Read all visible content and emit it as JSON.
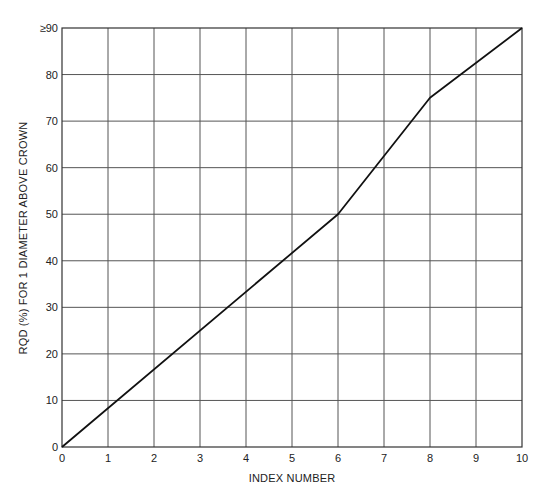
{
  "chart_data": {
    "type": "line",
    "title": "",
    "xlabel": "INDEX NUMBER",
    "ylabel": "RQD (%) FOR 1 DIAMETER ABOVE CROWN",
    "xlim": [
      0,
      10
    ],
    "ylim": [
      0,
      90
    ],
    "x_ticks": [
      "0",
      "1",
      "2",
      "3",
      "4",
      "5",
      "6",
      "7",
      "8",
      "9",
      "10"
    ],
    "y_ticks": [
      "0",
      "10",
      "20",
      "30",
      "40",
      "50",
      "60",
      "70",
      "80",
      "≥90"
    ],
    "grid": true,
    "legend": null,
    "series": [
      {
        "name": "RQD vs Index Number",
        "x": [
          0,
          1,
          2,
          3,
          4,
          5,
          6,
          7,
          8,
          9,
          10
        ],
        "values": [
          0,
          8.3,
          16.7,
          25,
          33.3,
          41.7,
          50,
          62.5,
          75,
          82.5,
          90
        ]
      }
    ],
    "breakpoints": [
      {
        "x": 0,
        "y": 0
      },
      {
        "x": 6,
        "y": 50
      },
      {
        "x": 8,
        "y": 75
      },
      {
        "x": 10,
        "y": 90
      }
    ]
  },
  "labels": {
    "x_axis_title": "INDEX NUMBER",
    "y_axis_title": "RQD (%) FOR 1 DIAMETER ABOVE CROWN",
    "y_top_tick": "≥90"
  }
}
